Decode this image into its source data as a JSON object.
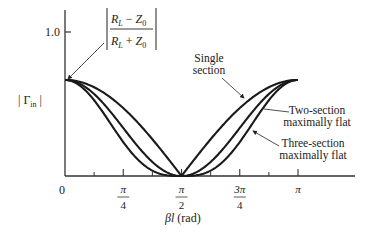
{
  "chart_data": {
    "type": "line",
    "title": "",
    "xlabel": "βl (rad)",
    "ylabel": "| Γin |",
    "xlim": [
      0,
      3.14159
    ],
    "ylim": [
      0,
      1.0
    ],
    "x_ticks": [
      {
        "value": 0,
        "label": "0"
      },
      {
        "value": 0.7854,
        "num": "π",
        "den": "4"
      },
      {
        "value": 1.5708,
        "num": "π",
        "den": "2"
      },
      {
        "value": 2.3562,
        "num": "3π",
        "den": "4"
      },
      {
        "value": 3.14159,
        "label": "π"
      }
    ],
    "x_minor_ticks": [
      0.3927,
      1.1781,
      1.9635,
      2.7489
    ],
    "y_ticks": [
      {
        "value": 1.0,
        "label": "1.0"
      }
    ],
    "gamma_max": 0.667,
    "series": [
      {
        "name": "Single section",
        "formula": "gamma_max*|cos(βl)|",
        "power": 1,
        "x": [
          0,
          0.3927,
          0.7854,
          1.1781,
          1.5708,
          1.9635,
          2.3562,
          2.7489,
          3.14159
        ],
        "y": [
          0.667,
          0.616,
          0.472,
          0.255,
          0,
          0.255,
          0.472,
          0.616,
          0.667
        ]
      },
      {
        "name": "Two-section maximally flat",
        "formula": "gamma_max*cos^2(βl)",
        "power": 2,
        "x": [
          0,
          0.3927,
          0.7854,
          1.1781,
          1.5708,
          1.9635,
          2.3562,
          2.7489,
          3.14159
        ],
        "y": [
          0.667,
          0.569,
          0.334,
          0.098,
          0,
          0.098,
          0.334,
          0.569,
          0.667
        ]
      },
      {
        "name": "Three-section maximally flat",
        "formula": "gamma_max*|cos^3(βl)|",
        "power": 3,
        "x": [
          0,
          0.3927,
          0.7854,
          1.1781,
          1.5708,
          1.9635,
          2.3562,
          2.7489,
          3.14159
        ],
        "y": [
          0.667,
          0.526,
          0.236,
          0.037,
          0,
          0.037,
          0.236,
          0.526,
          0.667
        ]
      }
    ],
    "annotations": [
      {
        "text_num": "RL − Z0",
        "text_den": "RL + Z0",
        "points_to": "start value at βl = 0"
      },
      {
        "text": [
          "Single",
          "section"
        ],
        "points_to": "Single section"
      },
      {
        "text": [
          "Two-section",
          "maximally flat"
        ],
        "points_to": "Two-section maximally flat"
      },
      {
        "text": [
          "Three-section",
          "maximally flat"
        ],
        "points_to": "Three-section maximally flat"
      }
    ],
    "grid": false,
    "legend": "none"
  }
}
